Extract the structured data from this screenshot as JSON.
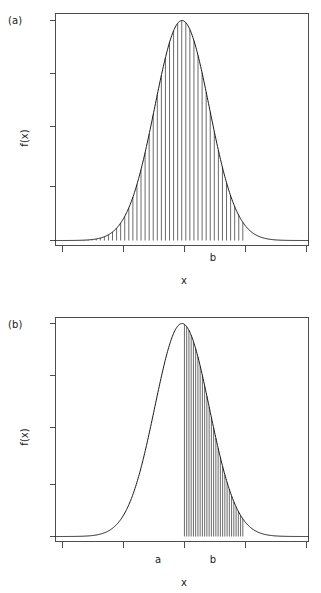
{
  "figure": {
    "background": "#ffffff",
    "ink_color": "#1a1a1a",
    "axis_color": "#4d4d4d"
  },
  "panels": [
    {
      "tag": "(a)",
      "ylabel": "f(x)",
      "xlabel": "x",
      "bound_labels": [
        {
          "text": "b",
          "x_value": 2.5
        }
      ]
    },
    {
      "tag": "(b)",
      "ylabel": "f(x)",
      "xlabel": "x",
      "bound_labels": [
        {
          "text": "a",
          "x_value": 0.1
        },
        {
          "text": "b",
          "x_value": 2.5
        }
      ]
    }
  ],
  "chart_data": [
    {
      "type": "area",
      "title": "",
      "xlabel": "x",
      "ylabel": "f(x)",
      "grid": false,
      "legend": null,
      "curve": "normal probability density function",
      "mean": 0,
      "sd": 1.12,
      "xlim": [
        -5.2,
        5.2
      ],
      "ylim": [
        0,
        0.385
      ],
      "xticks": [
        -4,
        -2,
        0,
        2,
        4
      ],
      "yticks": [
        0.0,
        0.1,
        0.2,
        0.3,
        0.4
      ],
      "xtick_labels": [
        "",
        "",
        "",
        "",
        ""
      ],
      "ytick_labels": [
        "",
        "",
        "",
        "",
        ""
      ],
      "shaded_region": {
        "style": "vertical line hatching",
        "from": -5.2,
        "to": 2.5,
        "from_label": "",
        "to_label": "b",
        "n_lines": 46,
        "meaning": "P(X <= b)"
      }
    },
    {
      "type": "area",
      "title": "",
      "xlabel": "x",
      "ylabel": "f(x)",
      "grid": false,
      "legend": null,
      "curve": "normal probability density function",
      "mean": 0,
      "sd": 1.12,
      "xlim": [
        -5.2,
        5.2
      ],
      "ylim": [
        0,
        0.385
      ],
      "xticks": [
        -4,
        -2,
        0,
        2,
        4
      ],
      "yticks": [
        0.0,
        0.1,
        0.2,
        0.3,
        0.4
      ],
      "xtick_labels": [
        "",
        "",
        "",
        "",
        ""
      ],
      "ytick_labels": [
        "",
        "",
        "",
        "",
        ""
      ],
      "shaded_region": {
        "style": "vertical line hatching",
        "from": 0.1,
        "to": 2.5,
        "from_label": "a",
        "to_label": "b",
        "n_lines": 26,
        "meaning": "P(a <= X <= b)"
      }
    }
  ]
}
